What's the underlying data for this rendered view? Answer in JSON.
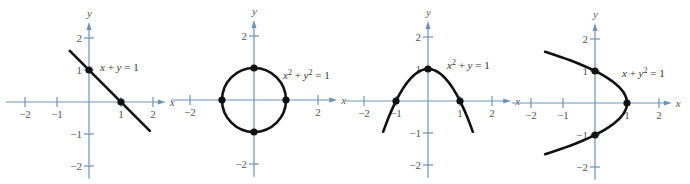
{
  "colors": {
    "axis": "#6b93ba",
    "curve": "#111111",
    "text": "#444444"
  },
  "unit_px": 32,
  "chart_data": [
    {
      "type": "line",
      "title": "x + y = 1",
      "equation": {
        "parts": [
          "x",
          " + ",
          "y",
          " = 1"
        ]
      },
      "origin": [
        89,
        102
      ],
      "xlabel": "x",
      "ylabel": "y",
      "xticks": [
        -2,
        -1,
        1,
        2
      ],
      "yticks": [
        -2,
        -1,
        1,
        2
      ],
      "xtick_labels": [
        "−2",
        "−1",
        "1",
        "2"
      ],
      "ytick_labels": [
        "2",
        "1",
        "−1",
        "−2"
      ],
      "xlim": [
        -2.6,
        2.4
      ],
      "ylim": [
        -2.4,
        2.5
      ],
      "curve": {
        "kind": "line",
        "x_from": -0.6,
        "x_to": 1.9
      },
      "points": [
        [
          0,
          1
        ],
        [
          1,
          0
        ]
      ],
      "label_pos": [
        100,
        71
      ]
    },
    {
      "type": "line",
      "title": "x^2 + y^2 = 1",
      "equation": {
        "parts": [
          "x",
          "2",
          " + ",
          "y",
          "2",
          " = 1"
        ]
      },
      "origin": [
        254,
        100
      ],
      "xlabel": "x",
      "ylabel": "y",
      "xticks": [
        -2,
        2
      ],
      "yticks": [
        -2,
        2
      ],
      "xtick_labels": [
        "−2",
        "2"
      ],
      "ytick_labels": [
        "2",
        "−2"
      ],
      "xlim": [
        -2.6,
        2.6
      ],
      "ylim": [
        -2.4,
        2.5
      ],
      "curve": {
        "kind": "circle",
        "r": 1
      },
      "points": [
        [
          -1,
          0
        ],
        [
          1,
          0
        ],
        [
          0,
          1
        ],
        [
          0,
          -1
        ]
      ],
      "label_pos": [
        283,
        79
      ]
    },
    {
      "type": "line",
      "title": "x^2 + y = 1",
      "equation": {
        "parts": [
          "x",
          "2",
          " + ",
          "y",
          " = 1"
        ]
      },
      "origin": [
        428,
        101
      ],
      "xlabel": "x",
      "ylabel": "y",
      "xticks": [
        -2,
        -1,
        1,
        2
      ],
      "yticks": [
        -2,
        -1,
        1,
        2
      ],
      "xtick_labels": [
        "−2",
        "−1",
        "1",
        "2"
      ],
      "ytick_labels": [
        "2",
        "1",
        "−1",
        "−2"
      ],
      "xlim": [
        -2.6,
        2.6
      ],
      "ylim": [
        -2.4,
        2.5
      ],
      "curve": {
        "kind": "parabola_y",
        "x_from": -1.4,
        "x_to": 1.4
      },
      "points": [
        [
          -1,
          0
        ],
        [
          1,
          0
        ],
        [
          0,
          1
        ]
      ],
      "label_pos": [
        447,
        69
      ]
    },
    {
      "type": "line",
      "title": "x + y^2 = 1",
      "equation": {
        "parts": [
          "x",
          " + ",
          "y",
          "2",
          " = 1"
        ]
      },
      "origin": [
        595,
        103
      ],
      "xlabel": "x",
      "ylabel": "y",
      "xticks": [
        -2,
        -1,
        1,
        2
      ],
      "yticks": [
        -2,
        -1,
        1,
        2
      ],
      "xtick_labels": [
        "−2",
        "−1",
        "1",
        "2"
      ],
      "ytick_labels": [
        "2",
        "1",
        "−1",
        "−2"
      ],
      "xlim": [
        -2.6,
        2.4
      ],
      "ylim": [
        -2.4,
        2.5
      ],
      "curve": {
        "kind": "parabola_x",
        "y_from": -1.6,
        "y_to": 1.6
      },
      "points": [
        [
          0,
          1
        ],
        [
          0,
          -1
        ],
        [
          1,
          0
        ]
      ],
      "label_pos": [
        622,
        77
      ]
    }
  ]
}
